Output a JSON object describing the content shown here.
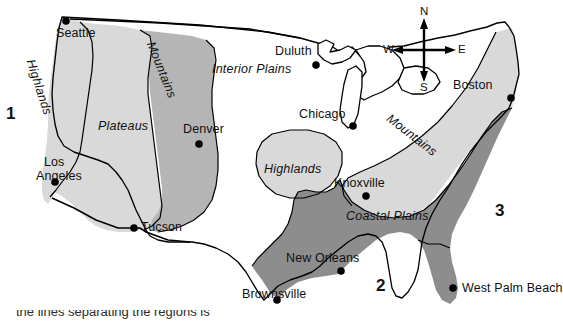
{
  "figure": {
    "name": "landform-regions-of-the-united-states-map",
    "background_color": "#ffffff",
    "width": 549,
    "height": 322
  },
  "palette": {
    "outline": "#000000",
    "region_light": "#d9d9d9",
    "region_mid": "#b5b5b5",
    "region_dark": "#8d8d8d",
    "region_white": "#ffffff",
    "text": "#111111"
  },
  "compass": {
    "name": "compass-rose",
    "north": "N",
    "south": "S",
    "east": "E",
    "west": "W"
  },
  "zone_numbers": [
    {
      "label": "1",
      "x": 6,
      "y": 113
    },
    {
      "label": "2",
      "x": 378,
      "y": 285
    },
    {
      "label": "3",
      "x": 497,
      "y": 210
    }
  ],
  "regions": [
    {
      "label": "Highlands",
      "x": 44,
      "y": 62,
      "rotation": 72,
      "shade": "#d9d9d9",
      "note": "pacific-coast-highlands"
    },
    {
      "label": "Plateaus",
      "x": 100,
      "y": 122,
      "rotation": 0,
      "shade": "#d9d9d9",
      "note": "western-plateaus"
    },
    {
      "label": "Mountains",
      "x": 160,
      "y": 45,
      "rotation": 68,
      "shade": "#b5b5b5",
      "note": "rocky-mountains"
    },
    {
      "label": "Interior Plains",
      "x": 215,
      "y": 68,
      "rotation": 0,
      "shade": "#ffffff",
      "note": "interior-plains"
    },
    {
      "label": "Highlands",
      "x": 266,
      "y": 168,
      "rotation": 0,
      "shade": "#d9d9d9",
      "note": "ozark-highlands"
    },
    {
      "label": "Mountains",
      "x": 398,
      "y": 118,
      "rotation": 38,
      "shade": "#d9d9d9",
      "note": "appalachian-mountains"
    },
    {
      "label": "Coastal Plains",
      "x": 350,
      "y": 214,
      "rotation": 0,
      "shade": "#8d8d8d",
      "note": "coastal-plains"
    }
  ],
  "cities": [
    {
      "name": "Seattle",
      "dot_x": 66,
      "dot_y": 21,
      "label_x": 58,
      "label_y": 33,
      "anchor": "start"
    },
    {
      "name": "Duluth",
      "dot_x": 316,
      "dot_y": 65,
      "label_x": 277,
      "label_y": 52,
      "anchor": "start"
    },
    {
      "name": "Boston",
      "dot_x": 511,
      "dot_y": 98,
      "label_x": 455,
      "label_y": 86,
      "anchor": "start"
    },
    {
      "name": "Chicago",
      "dot_x": 353,
      "dot_y": 126,
      "label_x": 301,
      "label_y": 115,
      "anchor": "start"
    },
    {
      "name": "Denver",
      "dot_x": 199,
      "dot_y": 144,
      "label_x": 185,
      "label_y": 129,
      "anchor": "start"
    },
    {
      "name": "Los Angeles",
      "dot_x": 55,
      "dot_y": 182,
      "label_x": 46,
      "label_y": 162,
      "anchor": "start"
    },
    {
      "name": "Knoxville",
      "dot_x": 366,
      "dot_y": 196,
      "label_x": 336,
      "label_y": 183,
      "anchor": "start"
    },
    {
      "name": "Tucson",
      "dot_x": 134,
      "dot_y": 228,
      "label_x": 140,
      "label_y": 222,
      "anchor": "start"
    },
    {
      "name": "New Orleans",
      "dot_x": 341,
      "dot_y": 271,
      "label_x": 288,
      "label_y": 259,
      "anchor": "start"
    },
    {
      "name": "Brownsville",
      "dot_x": 277,
      "dot_y": 300,
      "label_x": 244,
      "label_y": 288,
      "anchor": "start"
    },
    {
      "name": "West Palm Beach",
      "dot_x": 453,
      "dot_y": 288,
      "label_x": 461,
      "label_y": 282,
      "anchor": "start"
    }
  ],
  "city_label_lines": {
    "Los Angeles": [
      "Los",
      "Angeles"
    ]
  },
  "footer": {
    "cut_off_text": "the lines  separating the regions is",
    "note": "partially cropped text row at bottom edge"
  }
}
